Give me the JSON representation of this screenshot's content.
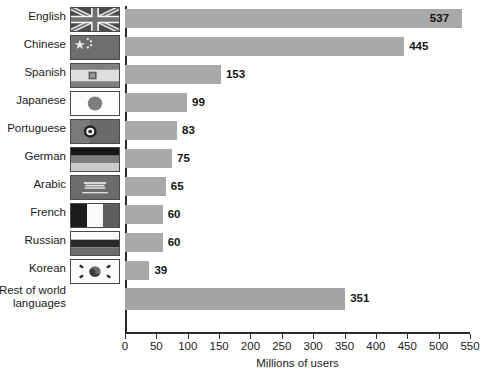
{
  "chart_data": {
    "type": "bar",
    "orientation": "horizontal",
    "title": "",
    "xlabel": "Millions of users",
    "ylabel": "",
    "xlim": [
      0,
      550
    ],
    "xticks": [
      0,
      50,
      100,
      150,
      200,
      250,
      300,
      350,
      400,
      450,
      500,
      550
    ],
    "grid": false,
    "legend": null,
    "bar_color": "#a9a9a9",
    "categories": [
      "English",
      "Chinese",
      "Spanish",
      "Japanese",
      "Portuguese",
      "German",
      "Arabic",
      "French",
      "Russian",
      "Korean",
      "Rest of world\nlanguages"
    ],
    "values": [
      537,
      445,
      153,
      99,
      83,
      75,
      65,
      60,
      60,
      39,
      351
    ],
    "data_labels": [
      "537",
      "445",
      "153",
      "99",
      "83",
      "75",
      "65",
      "60",
      "60",
      "39",
      "351"
    ],
    "flags": [
      "flag-united-kingdom",
      "flag-china",
      "flag-spain",
      "flag-japan",
      "flag-portugal",
      "flag-germany",
      "flag-saudi-arabia",
      "flag-france",
      "flag-russia",
      "flag-south-korea",
      null
    ]
  }
}
